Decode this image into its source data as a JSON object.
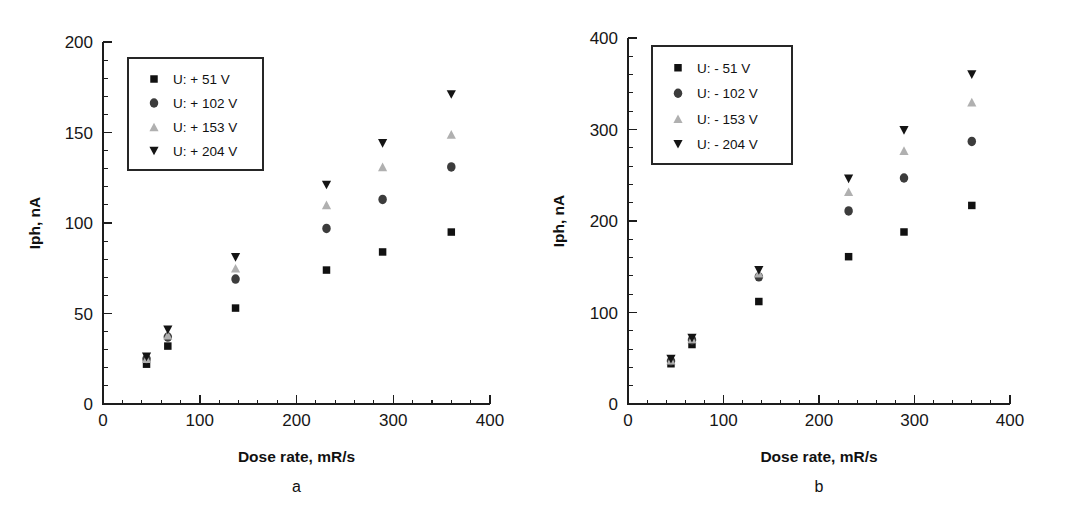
{
  "figure": {
    "caption_a": "a",
    "caption_b": "b"
  },
  "chart_data": [
    {
      "type": "scatter",
      "panel": "a",
      "title": "",
      "xlabel": "Dose rate, mR/s",
      "ylabel": "Iph, nA",
      "xlim": [
        0,
        400
      ],
      "ylim": [
        0,
        200
      ],
      "xticks": [
        0,
        100,
        200,
        300,
        400
      ],
      "yticks": [
        0,
        50,
        100,
        150,
        200
      ],
      "xtick_labels": [
        "0",
        "100",
        "200",
        "300",
        "400"
      ],
      "ytick_labels": [
        "0",
        "50",
        "100",
        "150",
        "200"
      ],
      "x_minor_step": 20,
      "y_minor_step": 10,
      "grid": false,
      "legend_position": "upper-left",
      "x": [
        45,
        67,
        137,
        231,
        289,
        360
      ],
      "series": [
        {
          "name": "U: + 51 V",
          "marker": "square",
          "color": "#111111",
          "values": [
            22,
            32,
            53,
            74,
            84,
            95
          ]
        },
        {
          "name": "U: + 102 V",
          "marker": "circle",
          "color": "#3c3c3c",
          "values": [
            25,
            37,
            69,
            97,
            113,
            131
          ]
        },
        {
          "name": "U: + 153 V",
          "marker": "triangle-up",
          "color": "#b0b0b0",
          "values": [
            25,
            38,
            75,
            110,
            131,
            149
          ]
        },
        {
          "name": "U: + 204 V",
          "marker": "triangle-down",
          "color": "#141414",
          "values": [
            26,
            41,
            81,
            121,
            144,
            171
          ]
        }
      ]
    },
    {
      "type": "scatter",
      "panel": "b",
      "title": "",
      "xlabel": "Dose rate, mR/s",
      "ylabel": "Iph, nA",
      "xlim": [
        0,
        400
      ],
      "ylim": [
        0,
        400
      ],
      "xticks": [
        0,
        100,
        200,
        300,
        400
      ],
      "yticks": [
        0,
        100,
        200,
        300,
        400
      ],
      "xtick_labels": [
        "0",
        "100",
        "200",
        "300",
        "400"
      ],
      "ytick_labels": [
        "0",
        "100",
        "200",
        "300",
        "400"
      ],
      "x_minor_step": 20,
      "y_minor_step": 20,
      "grid": false,
      "legend_position": "upper-left",
      "x": [
        45,
        67,
        137,
        231,
        289,
        360
      ],
      "series": [
        {
          "name": "U: - 51 V",
          "marker": "square",
          "color": "#111111",
          "values": [
            44,
            65,
            112,
            161,
            188,
            217
          ]
        },
        {
          "name": "U: - 102 V",
          "marker": "circle",
          "color": "#3c3c3c",
          "values": [
            47,
            70,
            139,
            211,
            247,
            287
          ]
        },
        {
          "name": "U: - 153 V",
          "marker": "triangle-up",
          "color": "#b0b0b0",
          "values": [
            48,
            71,
            143,
            232,
            277,
            330
          ]
        },
        {
          "name": "U: - 204 V",
          "marker": "triangle-down",
          "color": "#141414",
          "values": [
            49,
            72,
            146,
            246,
            299,
            360
          ]
        }
      ]
    }
  ]
}
